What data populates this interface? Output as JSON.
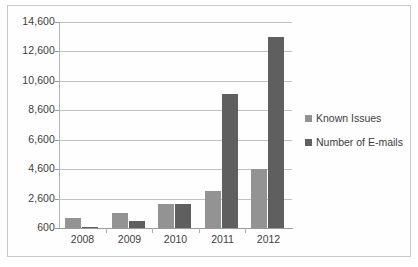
{
  "chart_data": {
    "type": "bar",
    "title": "",
    "subtitle": "",
    "xlabel": "",
    "ylabel": "",
    "categories": [
      "2008",
      "2009",
      "2010",
      "2011",
      "2012"
    ],
    "series": [
      {
        "name": "Known Issues",
        "color": "#939393",
        "values": [
          1300,
          1600,
          2200,
          3100,
          4600
        ]
      },
      {
        "name": "Number of E-mails",
        "color": "#5f5f5f",
        "values": [
          700,
          1100,
          2200,
          9700,
          13600
        ]
      }
    ],
    "ylim": [
      600,
      14600
    ],
    "ytick_step": 2000,
    "ytick_labels": [
      "600",
      "2,600",
      "4,600",
      "6,600",
      "8,600",
      "10,600",
      "12,600",
      "14,600"
    ],
    "ytick_values": [
      600,
      2600,
      4600,
      6600,
      8600,
      10600,
      12600,
      14600
    ],
    "grid": true,
    "legend_position": "right",
    "legend": [
      {
        "label": "Known Issues",
        "color": "#939393"
      },
      {
        "label": "Number of E-mails",
        "color": "#5f5f5f"
      }
    ]
  },
  "axis": {
    "y_labels": [
      "14,600",
      "12,600",
      "10,600",
      "8,600",
      "6,600",
      "4,600",
      "2,600",
      "600"
    ],
    "x_labels": [
      "2008",
      "2009",
      "2010",
      "2011",
      "2012"
    ]
  }
}
